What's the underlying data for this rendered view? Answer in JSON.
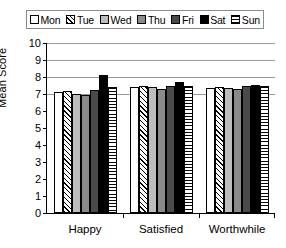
{
  "legend": {
    "position": "top",
    "items": [
      {
        "label": "Mon",
        "pattern": "p-white",
        "swatch": "white-swatch"
      },
      {
        "label": "Tue",
        "pattern": "p-diag",
        "swatch": "diagonal-hatch-swatch"
      },
      {
        "label": "Wed",
        "pattern": "p-ltgray",
        "swatch": "light-gray-swatch"
      },
      {
        "label": "Thu",
        "pattern": "p-mdgray",
        "swatch": "medium-gray-swatch"
      },
      {
        "label": "Fri",
        "pattern": "p-dkgray",
        "swatch": "dark-gray-swatch"
      },
      {
        "label": "Sat",
        "pattern": "p-black",
        "swatch": "black-swatch"
      },
      {
        "label": "Sun",
        "pattern": "p-horiz",
        "swatch": "horizontal-stripe-swatch"
      }
    ]
  },
  "axes": {
    "y_title": "Mean Score",
    "y_ticks": [
      "0",
      "1",
      "2",
      "3",
      "4",
      "5",
      "6",
      "7",
      "8",
      "9",
      "10"
    ],
    "x_title": "",
    "x_categories": [
      "Happy",
      "Satisfied",
      "Worthwhile"
    ]
  },
  "chart_data": {
    "type": "bar",
    "title": "",
    "xlabel": "",
    "ylabel": "Mean Score",
    "ylim": [
      0,
      10
    ],
    "ytick_step": 1,
    "grid": "horizontal gridlines at 7, 8, 9 and 10 only; tick marks at every integer 0-10",
    "legend_position": "top",
    "categories": [
      "Happy",
      "Satisfied",
      "Worthwhile"
    ],
    "series": [
      {
        "name": "Mon",
        "values": [
          7.1,
          7.4,
          7.35
        ]
      },
      {
        "name": "Tue",
        "values": [
          7.2,
          7.5,
          7.4
        ]
      },
      {
        "name": "Wed",
        "values": [
          7.0,
          7.4,
          7.35
        ]
      },
      {
        "name": "Thu",
        "values": [
          6.95,
          7.3,
          7.3
        ]
      },
      {
        "name": "Fri",
        "values": [
          7.25,
          7.5,
          7.5
        ]
      },
      {
        "name": "Sat",
        "values": [
          8.1,
          7.7,
          7.55
        ]
      },
      {
        "name": "Sun",
        "values": [
          7.4,
          7.5,
          7.45
        ]
      }
    ]
  }
}
